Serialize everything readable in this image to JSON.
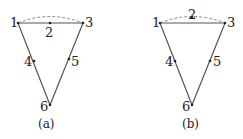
{
  "diagrams": [
    {
      "id": "a",
      "caption": "(a)",
      "nodes": [
        {
          "label": "1"
        },
        {
          "label": "2"
        },
        {
          "label": "3"
        },
        {
          "label": "4"
        },
        {
          "label": "5"
        },
        {
          "label": "6"
        }
      ],
      "solid_edges": [
        [
          "1",
          "3"
        ],
        [
          "1",
          "6"
        ],
        [
          "3",
          "6"
        ]
      ],
      "dashed_edges": [
        [
          "1",
          "3"
        ]
      ],
      "midside_nodes": {
        "2": "on-straight-edge",
        "4": "on-edge-1-6",
        "5": "on-edge-3-6"
      }
    },
    {
      "id": "b",
      "caption": "(b)",
      "nodes": [
        {
          "label": "1"
        },
        {
          "label": "2"
        },
        {
          "label": "3"
        },
        {
          "label": "4"
        },
        {
          "label": "5"
        },
        {
          "label": "6"
        }
      ],
      "solid_edges": [
        [
          "1",
          "3"
        ],
        [
          "1",
          "6"
        ],
        [
          "3",
          "6"
        ]
      ],
      "dashed_edges": [
        [
          "1",
          "3"
        ]
      ],
      "midside_nodes": {
        "2": "on-dashed-arc",
        "4": "on-edge-1-6",
        "5": "on-edge-3-6"
      }
    }
  ],
  "colors": {
    "line": "#555555",
    "dashed": "#888888",
    "text": "#222222"
  }
}
